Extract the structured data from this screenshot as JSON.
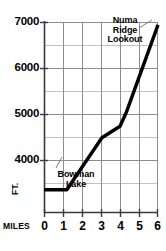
{
  "chart_data": {
    "type": "line",
    "title": "",
    "subtitle": "",
    "xlabel": "MILES",
    "ylabel": "FT.",
    "xlim": [
      0,
      6
    ],
    "ylim": [
      3700,
      7000
    ],
    "grid": true,
    "legend": "none",
    "x_ticks": [
      "0",
      "1",
      "2",
      "3",
      "4",
      "5",
      "6"
    ],
    "x_tick_values": [
      0,
      1,
      2,
      3,
      4,
      5,
      6
    ],
    "y_ticks": [
      "4000",
      "5000",
      "6000",
      "7000"
    ],
    "y_tick_values": [
      4000,
      5000,
      6000,
      7000
    ],
    "y_minor_gridlines": [
      4500,
      5500,
      6500
    ],
    "series": [
      {
        "name": "Trail elevation profile",
        "color": "#000000",
        "x": [
          0,
          1.2,
          3.05,
          4.0,
          4.35,
          6.0
        ],
        "y": [
          4100,
          4100,
          5000,
          5200,
          5450,
          6950
        ]
      }
    ],
    "annotations": [
      {
        "id": "bowman-lake",
        "text": "Bowman Lake",
        "line1": "Bowman",
        "line2": "Lake",
        "point_x": 0.95,
        "point_y": 4100
      },
      {
        "id": "numa-ridge-lookout",
        "text": "Numa Ridge Lookout",
        "line1": "Numa",
        "line2": "Ridge",
        "line3": "Lookout",
        "point_x": 5.75,
        "point_y": 6800
      }
    ]
  },
  "axes": {
    "x_label": "MILES",
    "y_label": "FT."
  },
  "ticks": {
    "y": [
      {
        "label": "7000"
      },
      {
        "label": "6000"
      },
      {
        "label": "5000"
      },
      {
        "label": "4000"
      }
    ],
    "x": [
      {
        "label": "0"
      },
      {
        "label": "1"
      },
      {
        "label": "2"
      },
      {
        "label": "3"
      },
      {
        "label": "4"
      },
      {
        "label": "5"
      },
      {
        "label": "6"
      }
    ]
  },
  "annotations": {
    "bowman": {
      "line1": "Bowman",
      "line2": "Lake"
    },
    "numa": {
      "line1": "Numa",
      "line2": "Ridge",
      "line3": "Lookout"
    }
  },
  "colors": {
    "line": "#000000",
    "grid_major": "#9a9a9a",
    "grid_minor": "#bdbdbd",
    "axis": "#4a4a4a",
    "background": "#ffffff"
  }
}
